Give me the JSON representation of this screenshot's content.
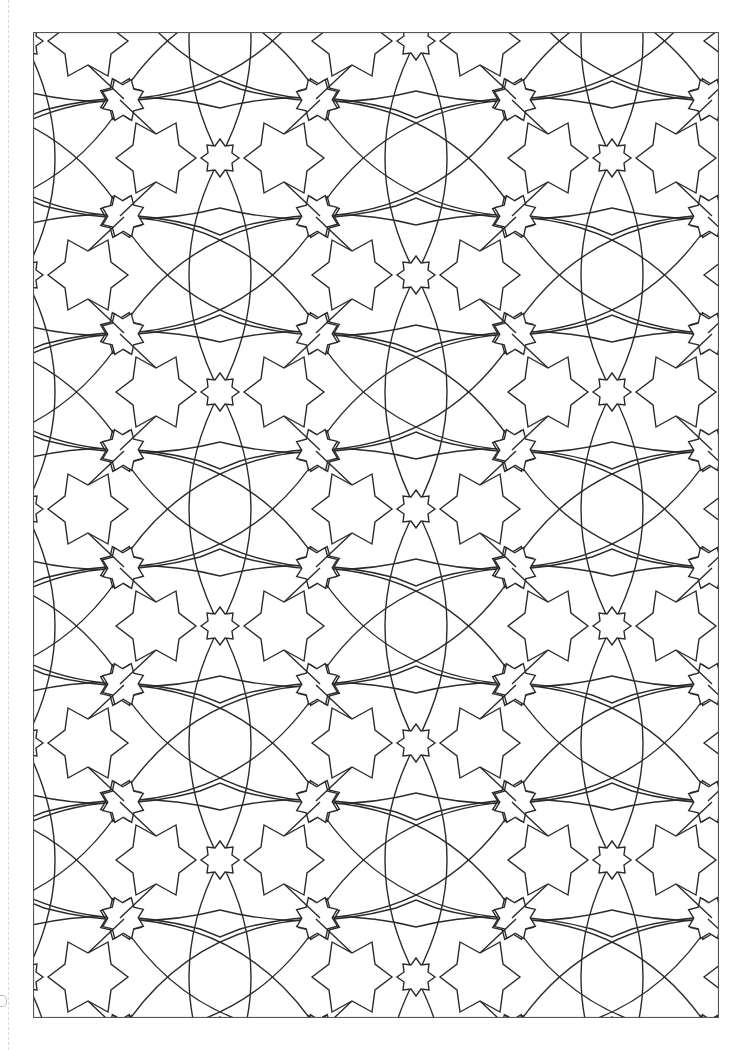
{
  "page": {
    "type": "coloring-page",
    "background_color": "#ffffff",
    "line_color": "#2b2b2b",
    "frame": {
      "x": 33,
      "y": 32,
      "width": 685,
      "height": 985
    }
  },
  "pattern": {
    "motifs": [
      {
        "name": "eight-point-square-star",
        "radius": 19
      },
      {
        "name": "six-point-star",
        "radius": 40
      },
      {
        "name": "small-eight-point-rotated-star",
        "radius": 22
      },
      {
        "name": "curved-lens-rosette",
        "petals": 6
      }
    ],
    "lattice": {
      "origin_x": 220,
      "origin_y": 158,
      "period_x": 392,
      "period_y": 234
    }
  },
  "margin": {
    "guide": "dashed-line",
    "mark": "binder-hole-mark"
  }
}
